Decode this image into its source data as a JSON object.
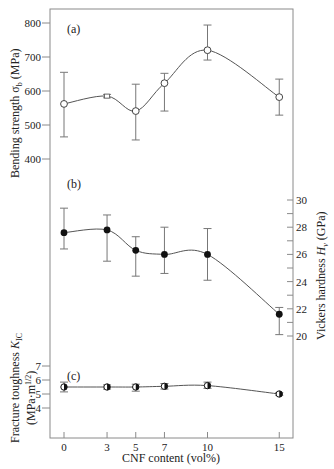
{
  "chart_data": {
    "type": "line",
    "title": "",
    "xlabel": "CNF content (vol%)",
    "x_ticks": [
      0,
      3,
      5,
      7,
      10,
      15
    ],
    "x": [
      0,
      3,
      5,
      7,
      10,
      15
    ],
    "panels": [
      {
        "id": "a",
        "label": "(a)",
        "ylabel": "Bending strength σb (MPa)",
        "axis_side": "left",
        "ylim": [
          400,
          800
        ],
        "y_ticks": [
          400,
          500,
          600,
          700,
          800
        ],
        "marker": "open-circle",
        "series": [
          {
            "name": "Bending strength",
            "values": [
              562,
              585,
              541,
              623,
              720,
              582
            ],
            "err_high": [
              655,
              590,
              620,
              652,
              794,
              635
            ],
            "err_low": [
              465,
              580,
              456,
              541,
              691,
              529
            ]
          }
        ]
      },
      {
        "id": "b",
        "label": "(b)",
        "ylabel": "Vickers hardness Hv (GPa)",
        "axis_side": "right",
        "ylim": [
          20,
          30
        ],
        "y_ticks": [
          20,
          22,
          24,
          26,
          28,
          30
        ],
        "marker": "filled-circle",
        "series": [
          {
            "name": "Vickers hardness",
            "values": [
              27.6,
              27.8,
              26.3,
              26.0,
              26.0,
              21.6
            ],
            "err_high": [
              29.4,
              28.9,
              27.3,
              28.0,
              27.9,
              22.1
            ],
            "err_low": [
              26.4,
              25.5,
              24.4,
              24.6,
              24.1,
              20.1
            ]
          }
        ]
      },
      {
        "id": "c",
        "label": "(c)",
        "ylabel": "Fracture toughness KIC (MPa·m1/2)",
        "axis_side": "left",
        "ylim": [
          4,
          7
        ],
        "y_ticks": [
          4,
          5,
          6,
          7
        ],
        "marker": "half-filled-circle",
        "series": [
          {
            "name": "Fracture toughness",
            "values": [
              5.5,
              5.5,
              5.5,
              5.55,
              5.6,
              5.0
            ],
            "err_high": [
              5.85,
              5.65,
              5.7,
              5.75,
              5.85,
              5.1
            ],
            "err_low": [
              5.15,
              5.35,
              5.2,
              5.35,
              5.4,
              4.9
            ]
          }
        ]
      }
    ],
    "grid": false,
    "legend": null
  },
  "labels": {
    "panel_a": "(a)",
    "panel_b": "(b)",
    "panel_c": "(c)",
    "ylabel_a": "Bending strength σ",
    "ylabel_a_sub": "b",
    "ylabel_a_unit": " (MPa)",
    "ylabel_b": "Vickers hardness ",
    "ylabel_b_sym": "H",
    "ylabel_b_sub": "v",
    "ylabel_b_unit": " (GPa)",
    "ylabel_c_line1": "Fracture toughness ",
    "ylabel_c_sym": "K",
    "ylabel_c_sub": "IC",
    "ylabel_c_line2": "(MPa·m",
    "ylabel_c_sup": "1/2",
    "ylabel_c_close": ")",
    "xlabel": "CNF content (vol%)"
  },
  "colors": {
    "axis": "#8a8a8a",
    "line": "#555555",
    "marker": "#111111",
    "text": "#222222"
  }
}
